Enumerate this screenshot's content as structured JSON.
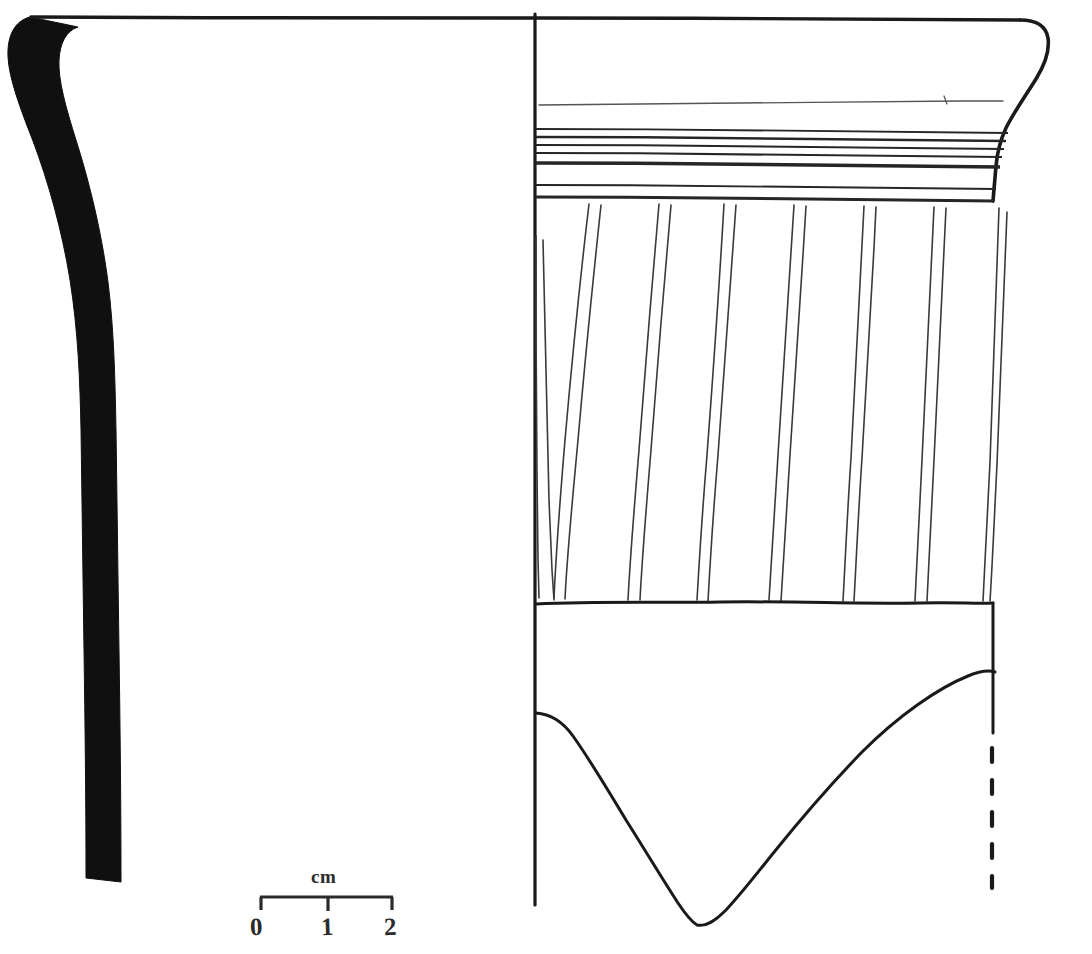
{
  "figure": {
    "kind": "archaeological-pottery-profile-drawing",
    "background_color": "#ffffff",
    "ink_color": "#1a1a1a",
    "width": 1092,
    "height": 954
  },
  "scale_bar": {
    "caption": "cm",
    "unit": "cm",
    "tick_labels": [
      "0",
      "1",
      "2"
    ],
    "tick_positions_px": [
      260,
      328,
      393
    ],
    "bar_y_px": 897,
    "major_divisions": 2,
    "px_per_unit": 66.5
  },
  "section_profile": {
    "label": "vessel-wall-section",
    "fill": "solid-black",
    "rim_top_y_px": 14,
    "base_y_px": 882,
    "rim_outer_x_px": 8,
    "wall_x_px": 85
  },
  "exterior_view": {
    "label": "vessel-exterior-elevation",
    "axis_x_px": 535,
    "axis_top_y_px": 14,
    "axis_bottom_y_px": 905,
    "rim_line_y_px": 17,
    "rim_right_x_px": 1045,
    "interior_line_y_px": 103,
    "banded_zone": {
      "label": "horizontal-grooved-band-zone",
      "top_y_px": 128,
      "bottom_y_px": 200,
      "band_count": 8,
      "band_y_px": [
        130,
        137,
        145,
        153,
        163,
        184,
        196,
        200
      ]
    },
    "combed_zone": {
      "label": "oblique-combed-decoration-zone",
      "top_y_px": 202,
      "bottom_y_px": 601,
      "pair_count": 8,
      "stroke_direction": "oblique-down-left",
      "pairs_top_x_px": [
        534,
        592,
        661,
        726,
        796,
        866,
        936,
        1001
      ],
      "pairs_bottom_x_px": [
        537,
        627,
        686,
        737,
        791,
        847,
        906,
        971
      ]
    },
    "plain_zone": {
      "label": "plain-lower-body-zone",
      "top_y_px": 601,
      "break_edge": "irregular-v-shaped-sherd-break"
    },
    "break_edge": {
      "label": "sherd-break-contour",
      "left_start_px": [
        536,
        713
      ],
      "low_point_px": [
        696,
        925
      ],
      "right_end_px": [
        995,
        672
      ]
    },
    "right_edge": {
      "label": "vessel-exterior-contour",
      "solid_bottom_y_px": 733,
      "dashed_from_y_px": 745,
      "dashed_to_y_px": 886,
      "dashed_x_px": 992,
      "dash_style": "reconstruction-dashed"
    }
  }
}
